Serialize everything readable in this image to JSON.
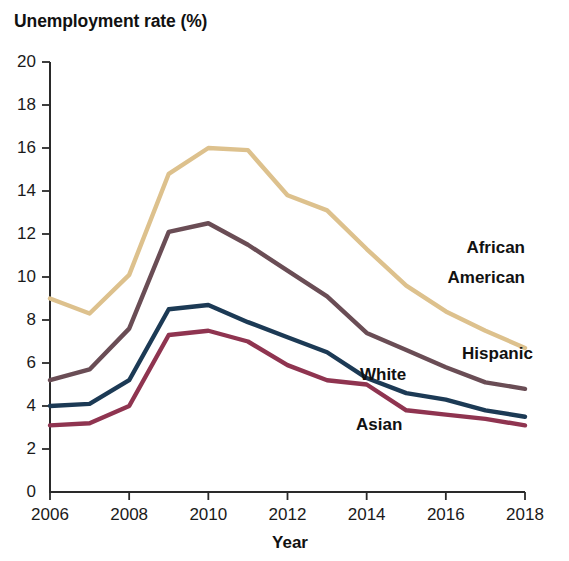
{
  "chart_data": {
    "type": "line",
    "title": "Unemployment rate (%)",
    "xlabel": "Year",
    "ylabel": "Unemployment rate (%)",
    "x": [
      2006,
      2007,
      2008,
      2009,
      2010,
      2011,
      2012,
      2013,
      2014,
      2015,
      2016,
      2017,
      2018
    ],
    "xlim": [
      2006,
      2018
    ],
    "ylim": [
      0,
      20
    ],
    "xticks": [
      2006,
      2008,
      2010,
      2012,
      2014,
      2016,
      2018
    ],
    "yticks": [
      0,
      2,
      4,
      6,
      8,
      10,
      12,
      14,
      16,
      18,
      20
    ],
    "xtick_labels": [
      "2006",
      "2008",
      "2010",
      "2012",
      "2014",
      "2016",
      "2018"
    ],
    "ytick_labels": [
      "0",
      "2",
      "4",
      "6",
      "8",
      "10",
      "12",
      "14",
      "16",
      "18",
      "20"
    ],
    "grid": false,
    "legend_position": "inline-annotations",
    "series": [
      {
        "name": "African American",
        "color": "#ddc18d",
        "label_lines": [
          "African",
          "American"
        ],
        "values": [
          9.0,
          8.3,
          10.1,
          14.8,
          16.0,
          15.9,
          13.8,
          13.1,
          11.3,
          9.6,
          8.4,
          7.5,
          6.7
        ]
      },
      {
        "name": "Hispanic",
        "color": "#6a4d55",
        "label_lines": [
          "Hispanic"
        ],
        "values": [
          5.2,
          5.7,
          7.6,
          12.1,
          12.5,
          11.5,
          10.3,
          9.1,
          7.4,
          6.6,
          5.8,
          5.1,
          4.8
        ]
      },
      {
        "name": "White",
        "color": "#1c3a55",
        "label_lines": [
          "White"
        ],
        "values": [
          4.0,
          4.1,
          5.2,
          8.5,
          8.7,
          7.9,
          7.2,
          6.5,
          5.3,
          4.6,
          4.3,
          3.8,
          3.5
        ]
      },
      {
        "name": "Asian",
        "color": "#8f3450",
        "label_lines": [
          "Asian"
        ],
        "values": [
          3.1,
          3.2,
          4.0,
          7.3,
          7.5,
          7.0,
          5.9,
          5.2,
          5.0,
          3.8,
          3.6,
          3.4,
          3.1
        ]
      }
    ],
    "annotations": [
      {
        "text": "African",
        "x": 2018.0,
        "y": 11.1
      },
      {
        "text": "American",
        "x": 2018.0,
        "y": 9.7
      },
      {
        "text": "Hispanic",
        "x": 2018.2,
        "y": 6.2
      },
      {
        "text": "White",
        "x": 2015.0,
        "y": 5.2
      },
      {
        "text": "Asian",
        "x": 2014.9,
        "y": 2.9
      }
    ]
  }
}
